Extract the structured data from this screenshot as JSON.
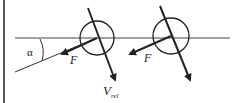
{
  "diagram": {
    "angle_label": "α",
    "force_label_left": "F",
    "force_label_right": "F",
    "velocity_label_main": "V",
    "velocity_label_sub": "rel"
  }
}
